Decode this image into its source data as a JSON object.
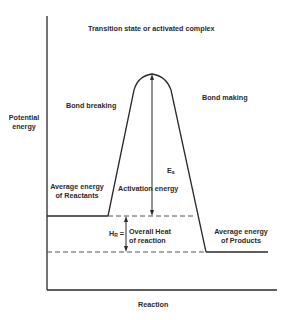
{
  "diagram": {
    "title": "Transition state or activated complex",
    "y_axis_label_line1": "Potential",
    "y_axis_label_line2": "energy",
    "x_axis_label": "Reaction",
    "bond_breaking": "Bond breaking",
    "bond_making": "Bond making",
    "reactants_line1": "Average energy",
    "reactants_line2": "of Reactants",
    "products_line1": "Average energy",
    "products_line2": "of Products",
    "activation_energy": "Activation energy",
    "ea_symbol": "E",
    "ea_subscript": "a",
    "hr_symbol": "H",
    "hr_subscript": "R",
    "hr_equals": "=",
    "heat_line1": "Overall Heat",
    "heat_line2": "of reaction",
    "colors": {
      "line": "#2a2a2a",
      "dash": "#555555",
      "text": "#2a2a2a"
    }
  }
}
